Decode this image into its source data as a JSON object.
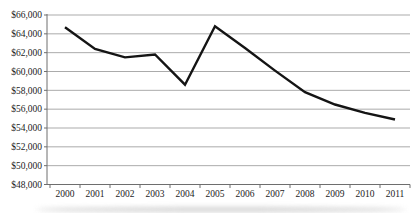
{
  "chart_data": {
    "type": "line",
    "title": "",
    "xlabel": "",
    "ylabel": "",
    "categories": [
      "2000",
      "2001",
      "2002",
      "2003",
      "2004",
      "2005",
      "2006",
      "2007",
      "2008",
      "2009",
      "2010",
      "2011"
    ],
    "series": [
      {
        "name": "dollar-value-line",
        "values": [
          64700,
          62400,
          61500,
          61800,
          58600,
          64800,
          62500,
          60100,
          57800,
          56500,
          55600,
          54900
        ],
        "color": "#141414",
        "stroke_width": 2.4
      }
    ],
    "ylim": [
      48000,
      66000
    ],
    "ytick_step": 2000,
    "ytick_values": [
      66000,
      64000,
      62000,
      60000,
      58000,
      56000,
      54000,
      52000,
      50000,
      48000
    ],
    "ytick_labels": [
      "$66,000",
      "$64,000",
      "$62,000",
      "$60,000",
      "$58,000",
      "$56,000",
      "$54,000",
      "$52,000",
      "$50,000",
      "$48,000"
    ],
    "grid": true,
    "legend_position": "none",
    "gridline_color": "#ababab",
    "axis_color": "#6e6e6e",
    "tick_color": "#6e6e6e",
    "label_color": "#1c1c1c"
  }
}
